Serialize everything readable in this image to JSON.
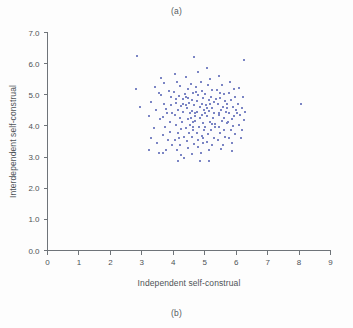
{
  "figure": {
    "caption_top": "(a)",
    "caption_bottom": "(b)",
    "marker_color": "#7b85c4",
    "axis_color": "#6f7479",
    "background": "#fdfdfd"
  },
  "chart_data": {
    "type": "scatter",
    "title": "",
    "xlabel": "Independent self-construal",
    "ylabel": "Interdependent self-construal",
    "xlim": [
      0,
      9
    ],
    "ylim": [
      0.0,
      7.0
    ],
    "xticks": [
      "0",
      "1",
      "2",
      "3",
      "4",
      "5",
      "6",
      "7",
      "8",
      "9"
    ],
    "yticks": [
      "0.0",
      "1.0",
      "2.0",
      "3.0",
      "4.0",
      "5.0",
      "6.0",
      "7.0"
    ],
    "grid": false,
    "legend": null,
    "marker": "square",
    "marker_size_px": 2,
    "series_name": "participants",
    "points": [
      [
        2.86,
        6.24
      ],
      [
        4.66,
        6.22
      ],
      [
        6.25,
        6.12
      ],
      [
        2.8,
        5.17
      ],
      [
        2.93,
        4.6
      ],
      [
        8.05,
        4.7
      ],
      [
        3.42,
        5.25
      ],
      [
        3.55,
        5.05
      ],
      [
        3.62,
        4.98
      ],
      [
        3.3,
        4.77
      ],
      [
        3.46,
        4.5
      ],
      [
        3.24,
        4.33
      ],
      [
        3.58,
        4.22
      ],
      [
        3.38,
        3.92
      ],
      [
        3.3,
        3.6
      ],
      [
        3.49,
        3.44
      ],
      [
        3.22,
        3.24
      ],
      [
        3.55,
        3.12
      ],
      [
        3.72,
        5.38
      ],
      [
        3.86,
        5.12
      ],
      [
        3.92,
        4.92
      ],
      [
        3.7,
        4.7
      ],
      [
        3.78,
        4.55
      ],
      [
        3.95,
        4.4
      ],
      [
        3.66,
        4.28
      ],
      [
        3.88,
        4.12
      ],
      [
        3.74,
        3.98
      ],
      [
        3.9,
        3.82
      ],
      [
        3.68,
        3.7
      ],
      [
        3.84,
        3.55
      ],
      [
        3.96,
        3.38
      ],
      [
        3.76,
        3.22
      ],
      [
        4.05,
        5.66
      ],
      [
        4.12,
        5.4
      ],
      [
        4.22,
        5.28
      ],
      [
        4.02,
        5.1
      ],
      [
        4.18,
        4.96
      ],
      [
        4.3,
        4.86
      ],
      [
        4.08,
        4.74
      ],
      [
        4.25,
        4.64
      ],
      [
        4.14,
        4.52
      ],
      [
        4.32,
        4.44
      ],
      [
        4.06,
        4.34
      ],
      [
        4.2,
        4.24
      ],
      [
        4.28,
        4.12
      ],
      [
        4.1,
        4.02
      ],
      [
        4.24,
        3.9
      ],
      [
        4.16,
        3.78
      ],
      [
        4.34,
        3.66
      ],
      [
        4.04,
        3.54
      ],
      [
        4.22,
        3.4
      ],
      [
        4.12,
        3.24
      ],
      [
        4.26,
        3.08
      ],
      [
        4.15,
        2.86
      ],
      [
        4.42,
        5.56
      ],
      [
        4.55,
        5.34
      ],
      [
        4.48,
        5.18
      ],
      [
        4.62,
        5.06
      ],
      [
        4.4,
        4.94
      ],
      [
        4.58,
        4.84
      ],
      [
        4.5,
        4.74
      ],
      [
        4.66,
        4.66
      ],
      [
        4.44,
        4.58
      ],
      [
        4.6,
        4.48
      ],
      [
        4.52,
        4.4
      ],
      [
        4.68,
        4.32
      ],
      [
        4.46,
        4.22
      ],
      [
        4.62,
        4.14
      ],
      [
        4.54,
        4.04
      ],
      [
        4.4,
        3.94
      ],
      [
        4.64,
        3.86
      ],
      [
        4.5,
        3.76
      ],
      [
        4.58,
        3.64
      ],
      [
        4.44,
        3.52
      ],
      [
        4.66,
        3.42
      ],
      [
        4.48,
        3.28
      ],
      [
        4.6,
        3.1
      ],
      [
        4.78,
        5.72
      ],
      [
        4.88,
        5.42
      ],
      [
        4.72,
        5.24
      ],
      [
        4.92,
        5.12
      ],
      [
        4.8,
        5.0
      ],
      [
        4.96,
        4.9
      ],
      [
        4.74,
        4.8
      ],
      [
        4.9,
        4.7
      ],
      [
        4.84,
        4.6
      ],
      [
        4.98,
        4.52
      ],
      [
        4.76,
        4.44
      ],
      [
        4.92,
        4.36
      ],
      [
        4.86,
        4.26
      ],
      [
        4.7,
        4.16
      ],
      [
        4.94,
        4.08
      ],
      [
        4.82,
        3.98
      ],
      [
        4.97,
        3.88
      ],
      [
        4.74,
        3.78
      ],
      [
        4.9,
        3.68
      ],
      [
        4.8,
        3.56
      ],
      [
        4.95,
        3.44
      ],
      [
        4.78,
        3.32
      ],
      [
        4.88,
        3.14
      ],
      [
        4.84,
        2.86
      ],
      [
        5.06,
        5.86
      ],
      [
        5.18,
        5.52
      ],
      [
        5.1,
        5.3
      ],
      [
        5.24,
        5.16
      ],
      [
        5.02,
        5.04
      ],
      [
        5.2,
        4.94
      ],
      [
        5.12,
        4.84
      ],
      [
        5.28,
        4.76
      ],
      [
        5.04,
        4.66
      ],
      [
        5.22,
        4.58
      ],
      [
        5.14,
        4.48
      ],
      [
        5.3,
        4.4
      ],
      [
        5.08,
        4.32
      ],
      [
        5.26,
        4.24
      ],
      [
        5.16,
        4.14
      ],
      [
        5.32,
        4.06
      ],
      [
        5.0,
        3.96
      ],
      [
        5.2,
        3.86
      ],
      [
        5.1,
        3.74
      ],
      [
        5.28,
        3.62
      ],
      [
        5.06,
        3.5
      ],
      [
        5.24,
        3.38
      ],
      [
        5.14,
        3.22
      ],
      [
        5.44,
        5.6
      ],
      [
        5.56,
        5.3
      ],
      [
        5.4,
        5.14
      ],
      [
        5.6,
        5.02
      ],
      [
        5.48,
        4.9
      ],
      [
        5.64,
        4.8
      ],
      [
        5.42,
        4.7
      ],
      [
        5.58,
        4.62
      ],
      [
        5.52,
        4.52
      ],
      [
        5.68,
        4.44
      ],
      [
        5.46,
        4.34
      ],
      [
        5.62,
        4.26
      ],
      [
        5.54,
        4.16
      ],
      [
        5.7,
        4.08
      ],
      [
        5.44,
        3.98
      ],
      [
        5.6,
        3.88
      ],
      [
        5.5,
        3.76
      ],
      [
        5.66,
        3.66
      ],
      [
        5.42,
        3.54
      ],
      [
        5.58,
        3.4
      ],
      [
        5.52,
        3.26
      ],
      [
        5.8,
        5.42
      ],
      [
        5.92,
        5.2
      ],
      [
        5.76,
        5.06
      ],
      [
        5.96,
        4.94
      ],
      [
        5.84,
        4.84
      ],
      [
        5.72,
        4.72
      ],
      [
        5.9,
        4.62
      ],
      [
        5.98,
        4.52
      ],
      [
        5.78,
        4.42
      ],
      [
        5.94,
        4.32
      ],
      [
        5.86,
        4.22
      ],
      [
        5.74,
        4.12
      ],
      [
        5.9,
        4.0
      ],
      [
        5.82,
        3.88
      ],
      [
        5.96,
        3.74
      ],
      [
        5.78,
        3.6
      ],
      [
        5.88,
        3.44
      ],
      [
        6.1,
        5.22
      ],
      [
        6.22,
        4.92
      ],
      [
        6.06,
        4.72
      ],
      [
        6.18,
        4.58
      ],
      [
        6.28,
        4.46
      ],
      [
        6.12,
        4.34
      ],
      [
        6.24,
        4.18
      ],
      [
        6.08,
        4.04
      ],
      [
        6.2,
        3.86
      ],
      [
        6.14,
        3.62
      ],
      [
        3.62,
        5.55
      ],
      [
        4.36,
        5.02
      ],
      [
        4.7,
        4.4
      ],
      [
        5.18,
        4.7
      ],
      [
        5.36,
        4.88
      ],
      [
        4.4,
        4.66
      ],
      [
        5.02,
        4.4
      ],
      [
        4.56,
        4.26
      ],
      [
        4.3,
        4.7
      ],
      [
        5.08,
        4.56
      ],
      [
        4.62,
        3.96
      ],
      [
        5.32,
        3.96
      ],
      [
        4.96,
        3.62
      ],
      [
        4.18,
        3.62
      ],
      [
        5.7,
        4.56
      ],
      [
        3.92,
        4.66
      ],
      [
        4.08,
        4.88
      ],
      [
        5.44,
        4.4
      ],
      [
        5.24,
        4.06
      ],
      [
        4.46,
        4.9
      ],
      [
        4.72,
        5.08
      ],
      [
        5.5,
        5.06
      ],
      [
        3.8,
        4.4
      ],
      [
        6.02,
        4.4
      ],
      [
        4.34,
        2.98
      ],
      [
        5.14,
        2.88
      ],
      [
        3.68,
        3.14
      ],
      [
        5.88,
        3.2
      ]
    ]
  }
}
